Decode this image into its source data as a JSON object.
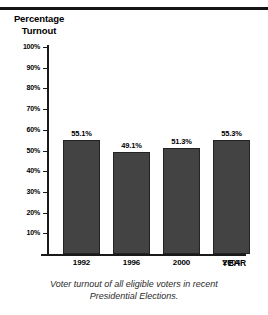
{
  "chart_data": {
    "type": "bar",
    "title": "",
    "ylabel": "Percentage Turnout",
    "xlabel": "YEAR",
    "categories": [
      "1992",
      "1996",
      "2000",
      "2004"
    ],
    "values": [
      55.1,
      49.1,
      51.3,
      55.3
    ],
    "value_labels": [
      "55.1%",
      "49.1%",
      "51.3%",
      "55.3%"
    ],
    "ylim": [
      0,
      100
    ],
    "yticks": [
      10,
      20,
      30,
      40,
      50,
      60,
      70,
      80,
      90,
      100
    ],
    "ytick_labels": [
      "10%",
      "20%",
      "30%",
      "40%",
      "50%",
      "60%",
      "70%",
      "80%",
      "90%",
      "100%"
    ],
    "grid": false,
    "legend": false,
    "bar_color": "#434343",
    "axis_color": "#1a1a1a",
    "caption": "Voter turnout of all eligible voters in recent Presidential Elections."
  },
  "axis_titles": {
    "y_line1": "Percentage",
    "y_line2": "Turnout",
    "x": "YEAR"
  },
  "caption": {
    "line1": "Voter turnout of all eligible voters in recent",
    "line2": "Presidential Elections."
  }
}
